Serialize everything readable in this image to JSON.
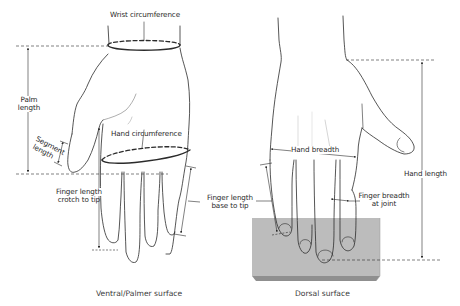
{
  "figure": {
    "panels": [
      {
        "id": "ventral",
        "caption": "Ventral/Palmer surface",
        "labels": {
          "wrist_circumference": "Wrist circumference",
          "palm_length_1": "Palm",
          "palm_length_2": "length",
          "segment_length_1": "Segment",
          "segment_length_2": "length",
          "hand_circumference": "Hand circumference",
          "finger_length_crotch_1": "Finger length",
          "finger_length_crotch_2": "crotch to tip"
        }
      },
      {
        "id": "dorsal",
        "caption": "Dorsal surface",
        "labels": {
          "hand_breadth": "Hand breadth",
          "finger_length_base_1": "Finger length",
          "finger_length_base_2": "base to tip",
          "finger_breadth_1": "Finger breadth",
          "finger_breadth_2": "at joint",
          "hand_length": "Hand length"
        }
      }
    ],
    "colors": {
      "line": "#2b2b2b",
      "block_face": "#b9b9b9",
      "block_edge": "#8e8e8e",
      "background": "#ffffff"
    }
  }
}
